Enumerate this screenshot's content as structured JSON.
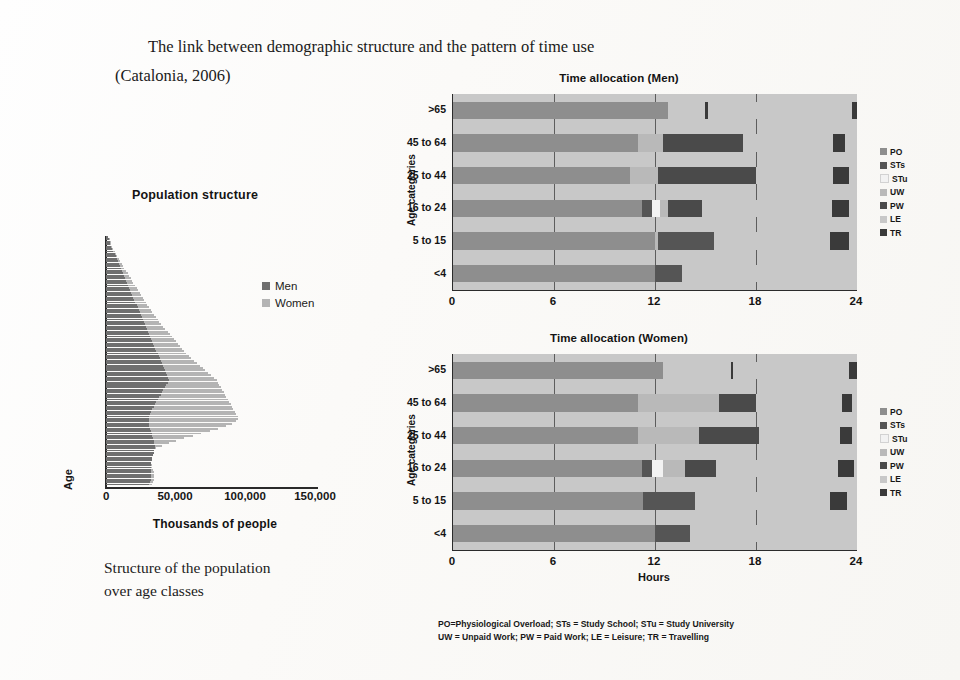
{
  "title": {
    "line1": "The link between demographic structure and the pattern of time use",
    "line2": "(Catalonia, 2006)"
  },
  "caption": {
    "line1": "Structure of the population",
    "line2": "over age classes"
  },
  "footnote": {
    "line1": "PO=Physiological Overload; STs = Study School; STu = Study University",
    "line2": "UW = Unpaid Work; PW = Paid Work; LE = Leisure; TR = Travelling"
  },
  "palette": {
    "PO": "#8e8e8e",
    "STs": "#555555",
    "STu": "#f2f2f2",
    "UW": "#b9b9b9",
    "PW": "#4a4a4a",
    "LE": "#c8c8c8",
    "TR": "#3a3a3a",
    "men": "#6f6f6f",
    "women": "#b4b4b4"
  },
  "chart_data": [
    {
      "id": "population-structure",
      "type": "bar",
      "orientation": "horizontal",
      "title": "Population structure",
      "xlabel": "Thousands of people",
      "ylabel": "Age",
      "xlim": [
        0,
        150000
      ],
      "xticks": [
        0,
        50000,
        100000,
        150000
      ],
      "xticklabels": [
        "0",
        "50,000",
        "100,000",
        "150,000"
      ],
      "grid": false,
      "legend": [
        "Men",
        "Women"
      ],
      "legend_position": "right",
      "note": "Stacked horizontal bars, one per single year of age; top = oldest, bottom = youngest",
      "series": [
        {
          "name": "Men",
          "values": [
            1500,
            2000,
            2600,
            3200,
            3900,
            4600,
            5300,
            6100,
            6800,
            7500,
            8300,
            9000,
            9800,
            10500,
            11300,
            12000,
            12800,
            13600,
            14300,
            15000,
            15800,
            16500,
            17300,
            18000,
            18800,
            19500,
            20300,
            21000,
            21800,
            22500,
            23300,
            24000,
            24800,
            25600,
            26300,
            27100,
            27800,
            28600,
            29300,
            30000,
            30800,
            31500,
            32300,
            33000,
            33800,
            34500,
            35300,
            36000,
            36800,
            37500,
            38300,
            39000,
            39800,
            40500,
            41300,
            42000,
            42800,
            43500,
            44300,
            45000,
            44000,
            43000,
            42000,
            41000,
            40000,
            39000,
            38000,
            37000,
            36000,
            35000,
            34000,
            33000,
            32000,
            31500,
            31000,
            30500,
            30500,
            30500,
            31000,
            31500,
            32000,
            32500,
            33000,
            33500,
            34000,
            34500,
            35000,
            35000,
            34500,
            34000,
            33500,
            33000,
            32500,
            32000,
            32000,
            32000,
            32000,
            32000,
            32000,
            32000,
            32000,
            31500,
            31000
          ]
        },
        {
          "name": "Women",
          "values": [
            1500,
            2200,
            2900,
            3600,
            4400,
            5100,
            6100,
            7000,
            8000,
            9000,
            10200,
            11200,
            12300,
            13200,
            14400,
            15400,
            16600,
            17600,
            18600,
            19600,
            20800,
            21800,
            23000,
            24000,
            25200,
            26200,
            27400,
            28400,
            29600,
            30600,
            32000,
            33000,
            34500,
            35500,
            37000,
            38000,
            39500,
            41000,
            42500,
            44000,
            45500,
            47000,
            48500,
            50000,
            51500,
            53000,
            54500,
            56000,
            57500,
            59000,
            61000,
            63000,
            65000,
            67000,
            69000,
            71000,
            73000,
            75000,
            77000,
            79000,
            80000,
            81000,
            82000,
            83000,
            84000,
            85000,
            86000,
            87000,
            88000,
            89000,
            90000,
            91000,
            92000,
            93000,
            94000,
            94500,
            93000,
            90000,
            86000,
            80000,
            74000,
            68000,
            62000,
            56000,
            50000,
            45000,
            40000,
            36000,
            33500,
            32000,
            31500,
            31500,
            31500,
            32000,
            32500,
            33000,
            33500,
            34000,
            34000,
            34000,
            34000,
            33500,
            33000
          ]
        }
      ]
    },
    {
      "id": "time-allocation-men",
      "type": "bar",
      "orientation": "horizontal",
      "stacked": true,
      "title": "Time allocation (Men)",
      "xlabel": "",
      "ylabel": "Age categories",
      "categories": [
        ">65",
        "45 to 64",
        "25 to 44",
        "16 to 24",
        "5 to 15",
        "<4"
      ],
      "xlim": [
        0,
        24
      ],
      "xticks": [
        0,
        6,
        12,
        18,
        24
      ],
      "xticklabels": [
        "0",
        "6",
        "12",
        "18",
        "24"
      ],
      "grid": true,
      "legend": [
        "PO",
        "STs",
        "STu",
        "UW",
        "PW",
        "LE",
        "TR"
      ],
      "legend_position": "right",
      "bars": [
        {
          "category": ">65",
          "segments": [
            [
              "PO",
              12.8
            ],
            [
              "LE",
              2.2
            ],
            [
              "TR",
              0.15
            ],
            [
              "LE",
              8.55
            ],
            [
              "TR",
              0.3
            ]
          ]
        },
        {
          "category": "45 to 64",
          "segments": [
            [
              "PO",
              11.0
            ],
            [
              "UW",
              1.5
            ],
            [
              "PW",
              4.7
            ],
            [
              "LE",
              5.4
            ],
            [
              "TR",
              0.7
            ],
            [
              "LE",
              0.7
            ]
          ]
        },
        {
          "category": "25 to 44",
          "segments": [
            [
              "PO",
              10.5
            ],
            [
              "UW",
              1.7
            ],
            [
              "PW",
              5.8
            ],
            [
              "LE",
              4.6
            ],
            [
              "TR",
              0.9
            ],
            [
              "LE",
              0.5
            ]
          ]
        },
        {
          "category": "16 to 24",
          "segments": [
            [
              "PO",
              11.2
            ],
            [
              "STs",
              0.6
            ],
            [
              "STu",
              0.5
            ],
            [
              "UW",
              0.5
            ],
            [
              "PW",
              2.0
            ],
            [
              "LE",
              7.7
            ],
            [
              "TR",
              1.0
            ],
            [
              "LE",
              0.5
            ]
          ]
        },
        {
          "category": "5 to 15",
          "segments": [
            [
              "PO",
              12.0
            ],
            [
              "UW",
              0.2
            ],
            [
              "STs",
              3.3
            ],
            [
              "LE",
              6.9
            ],
            [
              "TR",
              1.1
            ],
            [
              "LE",
              0.5
            ]
          ]
        },
        {
          "category": "<4",
          "segments": [
            [
              "PO",
              12.0
            ],
            [
              "STs",
              1.6
            ],
            [
              "LE",
              10.4
            ]
          ]
        }
      ]
    },
    {
      "id": "time-allocation-women",
      "type": "bar",
      "orientation": "horizontal",
      "stacked": true,
      "title": "Time allocation (Women)",
      "xlabel": "Hours",
      "ylabel": "Age categories",
      "categories": [
        ">65",
        "45 to 64",
        "25 to 44",
        "16 to 24",
        "5 to 15",
        "<4"
      ],
      "xlim": [
        0,
        24
      ],
      "xticks": [
        0,
        6,
        12,
        18,
        24
      ],
      "xticklabels": [
        "0",
        "6",
        "12",
        "18",
        "24"
      ],
      "grid": true,
      "legend": [
        "PO",
        "STs",
        "STu",
        "UW",
        "PW",
        "LE",
        "TR"
      ],
      "legend_position": "right",
      "bars": [
        {
          "category": ">65",
          "segments": [
            [
              "PO",
              12.5
            ],
            [
              "LE",
              4.0
            ],
            [
              "TR",
              0.15
            ],
            [
              "LE",
              6.85
            ],
            [
              "TR",
              0.5
            ]
          ]
        },
        {
          "category": "45 to 64",
          "segments": [
            [
              "PO",
              11.0
            ],
            [
              "UW",
              4.8
            ],
            [
              "PW",
              2.2
            ],
            [
              "LE",
              5.1
            ],
            [
              "TR",
              0.6
            ],
            [
              "LE",
              0.3
            ]
          ]
        },
        {
          "category": "25 to 44",
          "segments": [
            [
              "PO",
              11.0
            ],
            [
              "UW",
              3.6
            ],
            [
              "PW",
              3.6
            ],
            [
              "LE",
              4.8
            ],
            [
              "TR",
              0.7
            ],
            [
              "LE",
              0.3
            ]
          ]
        },
        {
          "category": "16 to 24",
          "segments": [
            [
              "PO",
              11.2
            ],
            [
              "STs",
              0.6
            ],
            [
              "STu",
              0.7
            ],
            [
              "UW",
              1.3
            ],
            [
              "PW",
              1.8
            ],
            [
              "LE",
              7.3
            ],
            [
              "TR",
              0.9
            ],
            [
              "LE",
              0.2
            ]
          ]
        },
        {
          "category": "5 to 15",
          "segments": [
            [
              "PO",
              11.3
            ],
            [
              "STs",
              3.1
            ],
            [
              "LE",
              8.0
            ],
            [
              "TR",
              1.0
            ],
            [
              "LE",
              0.6
            ]
          ]
        },
        {
          "category": "<4",
          "segments": [
            [
              "PO",
              12.0
            ],
            [
              "STs",
              2.1
            ],
            [
              "LE",
              9.9
            ]
          ]
        }
      ]
    }
  ]
}
